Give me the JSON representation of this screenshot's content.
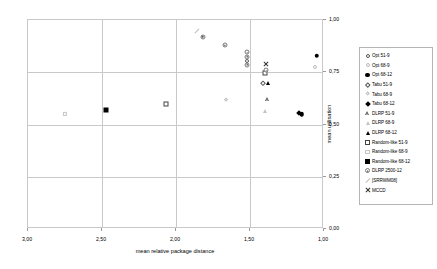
{
  "chart_data": {
    "type": "scatter",
    "title": "",
    "xlabel": "mean relative package distance",
    "ylabel": "mean utilisation",
    "xlim": [
      3.0,
      1.0
    ],
    "x_reversed": true,
    "ylim": [
      0.0,
      1.0
    ],
    "xticks": [
      "3,00",
      "2,50",
      "2,00",
      "1,50",
      "1,00"
    ],
    "xtick_values": [
      3.0,
      2.5,
      2.0,
      1.5,
      1.0
    ],
    "yticks": [
      "0,00",
      "0,25",
      "0,50",
      "0,75",
      "1,00"
    ],
    "ytick_values": [
      0.0,
      0.25,
      0.5,
      0.75,
      1.0
    ],
    "grid": true,
    "legend_position": "right",
    "series": [
      {
        "name": "Opt 51-9",
        "marker": "circle-open",
        "points": [
          [
            1.52,
            0.805
          ]
        ]
      },
      {
        "name": "Opt 68-9",
        "marker": "circle-gray",
        "points": [
          [
            1.06,
            0.775
          ]
        ]
      },
      {
        "name": "Opt 68-12",
        "marker": "circle-filled",
        "points": [
          [
            1.05,
            0.83
          ],
          [
            1.15,
            0.55
          ]
        ]
      },
      {
        "name": "Tabu 51-9",
        "marker": "diamond-open",
        "points": [
          [
            1.41,
            0.7
          ]
        ]
      },
      {
        "name": "Tabu 68-9",
        "marker": "diamond-gray",
        "points": [
          [
            1.66,
            0.615
          ]
        ]
      },
      {
        "name": "Tabu 68-12",
        "marker": "diamond-filled",
        "points": [
          [
            1.17,
            0.555
          ]
        ]
      },
      {
        "name": "DLRP 51-9",
        "marker": "triangle-open",
        "points": [
          [
            1.38,
            0.62
          ]
        ]
      },
      {
        "name": "DLRP 68-9",
        "marker": "triangle-gray",
        "points": [
          [
            1.4,
            0.565
          ]
        ]
      },
      {
        "name": "DLRP 68-12",
        "marker": "triangle-filled",
        "points": [
          [
            1.38,
            0.7
          ]
        ]
      },
      {
        "name": "Random-like 51-9",
        "marker": "square-open",
        "points": [
          [
            2.07,
            0.6
          ],
          [
            1.4,
            0.745
          ]
        ]
      },
      {
        "name": "Random-like 68-9",
        "marker": "square-gray",
        "points": [
          [
            2.75,
            0.55
          ]
        ]
      },
      {
        "name": "Random-like 68-12",
        "marker": "square-filled",
        "points": [
          [
            2.47,
            0.57
          ]
        ]
      },
      {
        "name": "DLRP 2500-12",
        "marker": "circle-dot",
        "points": [
          [
            1.82,
            0.92
          ],
          [
            1.67,
            0.88
          ],
          [
            1.52,
            0.845
          ],
          [
            1.52,
            0.825
          ],
          [
            1.52,
            0.785
          ],
          [
            1.39,
            0.76
          ]
        ]
      },
      {
        "name": "[SRRWM08]",
        "marker": "dash",
        "points": [
          [
            1.86,
            0.945
          ]
        ]
      },
      {
        "name": "MCCD",
        "marker": "x",
        "points": [
          [
            1.39,
            0.79
          ]
        ]
      }
    ]
  },
  "legend": {
    "items": [
      {
        "label": "Opt 51-9",
        "marker": "circle-open"
      },
      {
        "label": "Opt 68-9",
        "marker": "circle-gray"
      },
      {
        "label": "Opt 68-12",
        "marker": "circle-filled"
      },
      {
        "label": "Tabu 51-9",
        "marker": "diamond-open"
      },
      {
        "label": "Tabu 68-9",
        "marker": "diamond-gray"
      },
      {
        "label": "Tabu 68-12",
        "marker": "diamond-filled"
      },
      {
        "label": "DLRP 51-9",
        "marker": "triangle-open"
      },
      {
        "label": "DLRP 68-9",
        "marker": "triangle-gray"
      },
      {
        "label": "DLRP 68-12",
        "marker": "triangle-filled"
      },
      {
        "label": "Random-like 51-9",
        "marker": "square-open"
      },
      {
        "label": "Random-like 68-9",
        "marker": "square-gray"
      },
      {
        "label": "Random-like 68-12",
        "marker": "square-filled"
      },
      {
        "label": "DLRP 2500-12",
        "marker": "circle-dot"
      },
      {
        "label": "[SRRWM08]",
        "marker": "dash"
      },
      {
        "label": "MCCD",
        "marker": "x"
      }
    ]
  },
  "colors": {
    "grid": "#c9c9c9",
    "axis_text": "#000000",
    "marker_dark": "#000000",
    "marker_gray": "#c0c0c0"
  }
}
